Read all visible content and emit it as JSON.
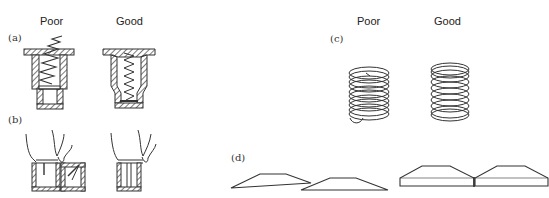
{
  "panels": {
    "a": {
      "label": "(a)",
      "poor": "Poor",
      "good": "Good"
    },
    "b": {
      "label": "(b)"
    },
    "c": {
      "label": "(c)",
      "poor": "Poor",
      "good": "Good"
    },
    "d": {
      "label": "(d)"
    }
  },
  "colors": {
    "line": "#333333",
    "background": "#ffffff"
  }
}
